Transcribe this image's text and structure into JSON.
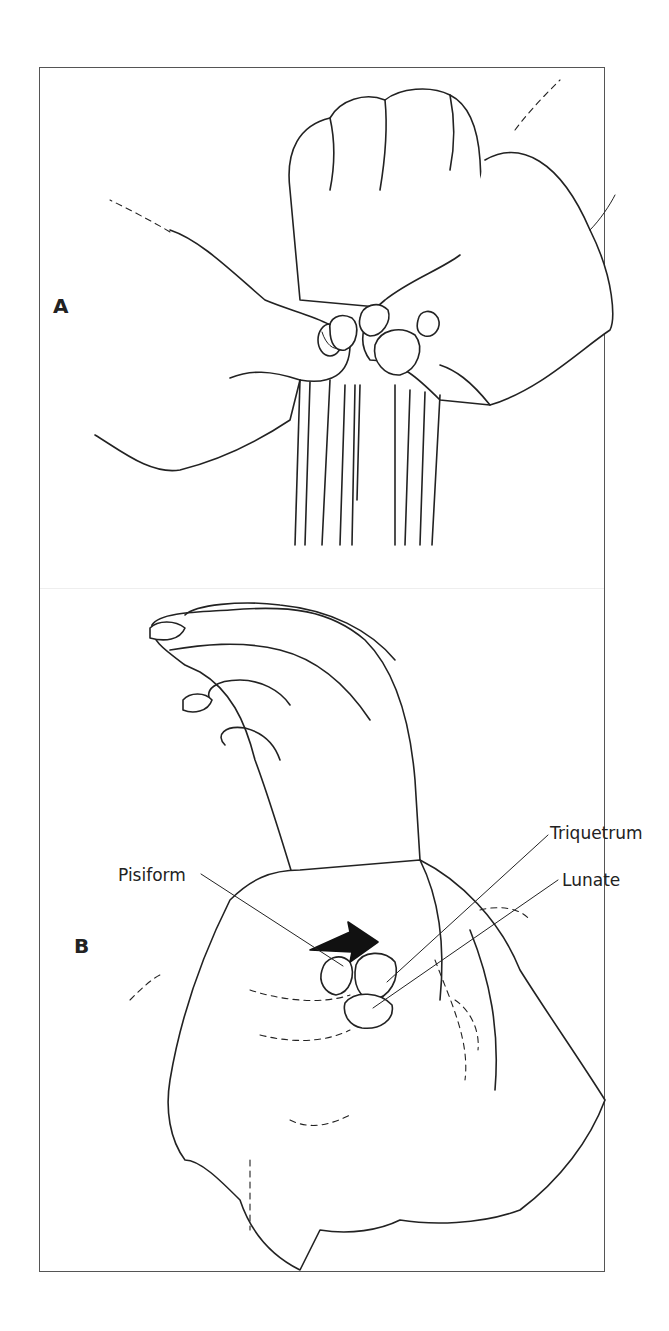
{
  "figure": {
    "panels": [
      {
        "id": "A",
        "label": "A"
      },
      {
        "id": "B",
        "label": "B"
      }
    ],
    "labels": {
      "triquetrum": "Triquetrum",
      "lunate": "Lunate",
      "pisiform": "Pisiform"
    },
    "signature": "Chike",
    "colors": {
      "line": "#222222",
      "frame": "#555555",
      "background": "#ffffff"
    }
  }
}
